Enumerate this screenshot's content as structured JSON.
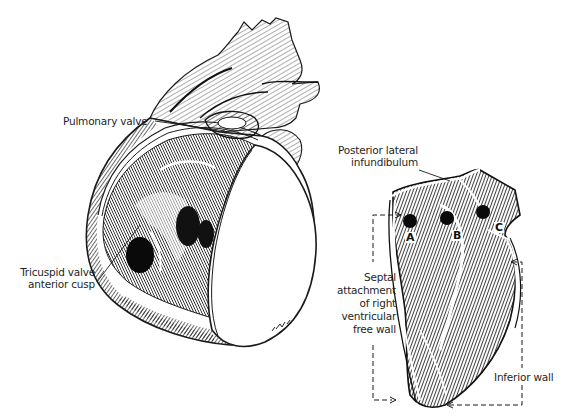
{
  "figure": {
    "left_panel": {
      "title": "Right ventricle opened, anterior view",
      "labels": {
        "pulmonary_valve": "Pulmonary valve",
        "tricuspid_line1": "Tricuspid valve",
        "tricuspid_line2": "anterior cusp"
      }
    },
    "right_panel": {
      "labels": {
        "infundibulum_line1": "Posterior lateral",
        "infundibulum_line2": "infundibulum",
        "septal_line1": "Septal",
        "septal_line2": "attachment",
        "septal_line3": "of right",
        "septal_line4": "ventricular",
        "septal_line5": "free wall",
        "inferior_wall": "Inferior wall"
      },
      "points": [
        "A",
        "B",
        "C"
      ]
    },
    "colors": {
      "ink": "#1a1a1a",
      "paper": "#ffffff"
    }
  }
}
